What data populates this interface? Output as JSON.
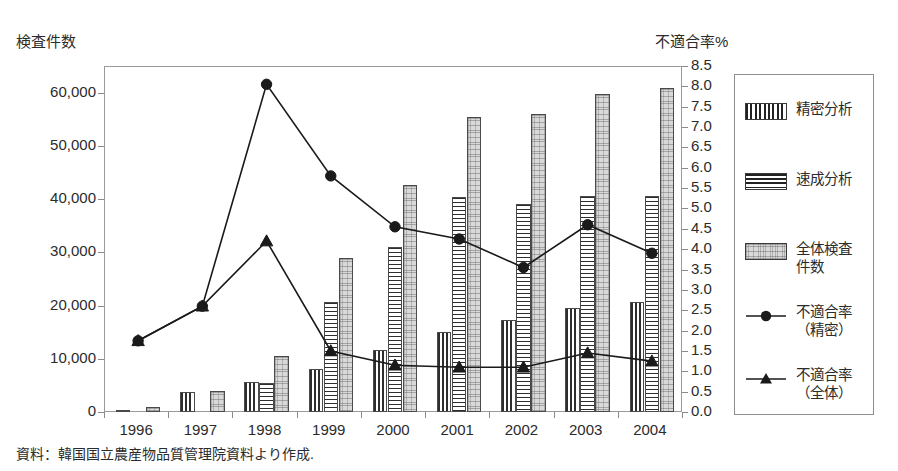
{
  "chart_data": {
    "type": "bar",
    "title": "",
    "xlabel": "",
    "ylabel": "検査件数",
    "y2label": "不適合率%",
    "categories": [
      "1996",
      "1997",
      "1998",
      "1999",
      "2000",
      "2001",
      "2002",
      "2003",
      "2004"
    ],
    "ylim": [
      0,
      65000
    ],
    "y2lim": [
      0.0,
      8.5
    ],
    "grid": false,
    "legend_position": "right",
    "yticks": [
      "0",
      "10,000",
      "20,000",
      "30,000",
      "40,000",
      "50,000",
      "60,000"
    ],
    "ytick_values": [
      0,
      10000,
      20000,
      30000,
      40000,
      50000,
      60000
    ],
    "y2ticks": [
      "0.0",
      "0.5",
      "1.0",
      "1.5",
      "2.0",
      "2.5",
      "3.0",
      "3.5",
      "4.0",
      "4.5",
      "5.0",
      "5.5",
      "6.0",
      "6.5",
      "7.0",
      "7.5",
      "8.0",
      "8.5"
    ],
    "y2tick_values": [
      0.0,
      0.5,
      1.0,
      1.5,
      2.0,
      2.5,
      3.0,
      3.5,
      4.0,
      4.5,
      5.0,
      5.5,
      6.0,
      6.5,
      7.0,
      7.5,
      8.0,
      8.5
    ],
    "series": [
      {
        "name": "精密分析",
        "kind": "bar",
        "axis": "left",
        "pattern": "vertical-hatch",
        "values": [
          400,
          3800,
          5600,
          8000,
          11700,
          15000,
          17200,
          19500,
          20700
        ]
      },
      {
        "name": "速成分析",
        "kind": "bar",
        "axis": "left",
        "pattern": "horizontal-hatch",
        "values": [
          0,
          0,
          5400,
          20600,
          31000,
          40400,
          39000,
          40500,
          40500
        ]
      },
      {
        "name": "全体検査件数",
        "kind": "bar",
        "axis": "left",
        "pattern": "light-dotted",
        "values": [
          900,
          3900,
          10600,
          28900,
          42700,
          55500,
          56000,
          59700,
          60800
        ]
      },
      {
        "name": "不適合率（精密）",
        "kind": "line",
        "axis": "right",
        "marker": "circle",
        "values": [
          1.75,
          2.6,
          8.05,
          5.8,
          4.55,
          4.25,
          3.55,
          4.6,
          3.9
        ]
      },
      {
        "name": "不適合率（全体）",
        "kind": "line",
        "axis": "right",
        "marker": "triangle",
        "values": [
          1.75,
          2.6,
          4.2,
          1.5,
          1.15,
          1.1,
          1.1,
          1.45,
          1.25
        ]
      }
    ]
  },
  "axes": {
    "left_title": "検査件数",
    "right_title": "不適合率%"
  },
  "legend": {
    "items": [
      {
        "label": "精密分析",
        "type": "swatch",
        "pattern": "vertical-hatch"
      },
      {
        "label": "速成分析",
        "type": "swatch",
        "pattern": "horizontal-hatch"
      },
      {
        "label": "全体検査\n件数",
        "type": "swatch",
        "pattern": "light-dotted"
      },
      {
        "label": "不適合率\n（精密）",
        "type": "line-marker",
        "marker": "circle"
      },
      {
        "label": "不適合率\n（全体）",
        "type": "line-marker",
        "marker": "triangle"
      }
    ]
  },
  "source_note": "資料：韓国国立農産物品質管理院資料より作成.",
  "colors": {
    "line": "#1a1a1a",
    "frame": "#9a9a9a",
    "bar_outline": "#4a4a4a",
    "total_fill": "#d9d9d9",
    "text": "#2b2b2b"
  }
}
